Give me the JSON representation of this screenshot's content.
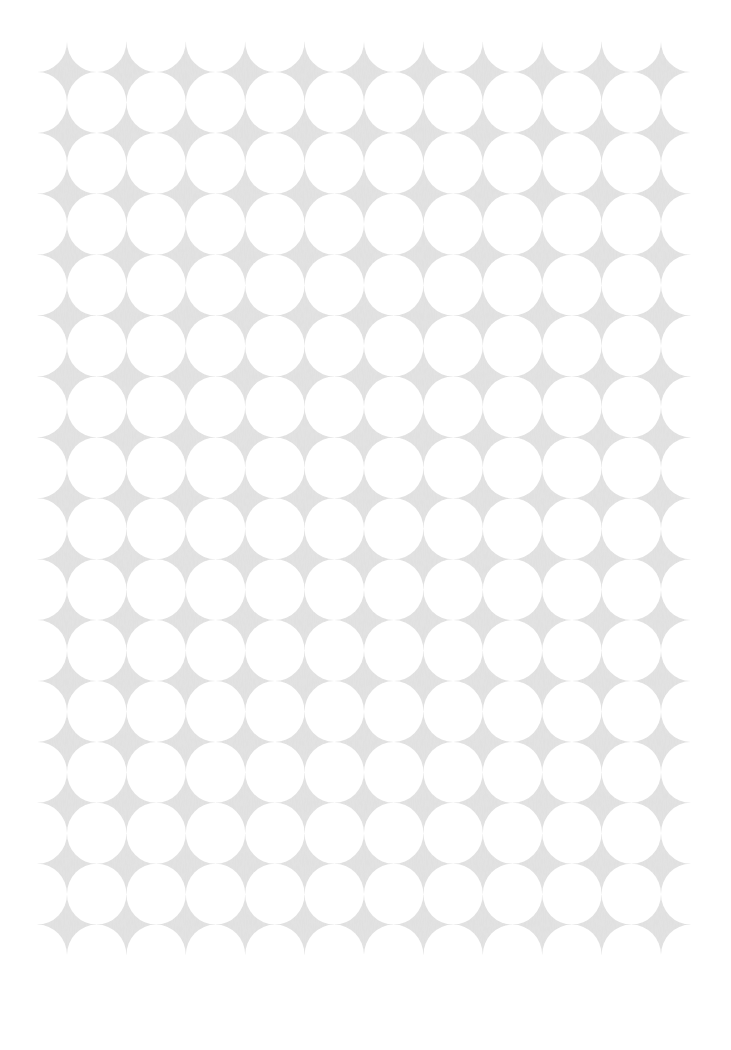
{
  "pattern": {
    "description": "Grid of white circles on light gray textured background forming four-pointed stars",
    "star_color": "#e3e3e3",
    "background_color": "#ffffff",
    "circle_color": "#ffffff",
    "columns": 11,
    "rows": 15,
    "origin_x": 67,
    "origin_y": 72,
    "spacing_x": 59.4,
    "spacing_y": 60.9,
    "circle_radius_x": 29.7,
    "circle_radius_y": 30.45
  }
}
